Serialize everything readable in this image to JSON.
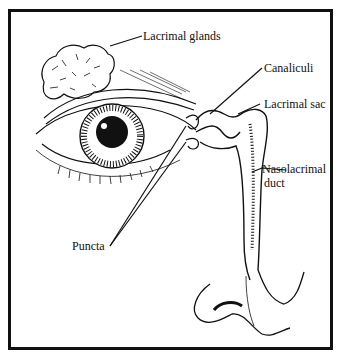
{
  "diagram": {
    "labels": {
      "lacrimal_glands": "Lacrimal glands",
      "canaliculi": "Canaliculi",
      "lacrimal_sac": "Lacrimal sac",
      "nasolacrimal_duct_line1": "Nasolacrimal",
      "nasolacrimal_duct_line2": "duct",
      "puncta": "Puncta"
    },
    "colors": {
      "ink": "#111111",
      "background": "#ffffff"
    }
  }
}
